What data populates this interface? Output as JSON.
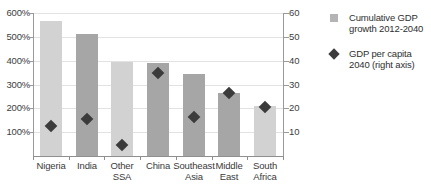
{
  "chart_data": {
    "type": "bar",
    "title": "",
    "categories": [
      "Nigeria",
      "India",
      "Other SSA",
      "China",
      "Southeast Asia",
      "Middle East",
      "South Africa"
    ],
    "series": [
      {
        "name": "Cumulative GDP growth 2012-2040",
        "type": "bar",
        "axis": "left",
        "unit": "%",
        "values": [
          565,
          510,
          395,
          390,
          345,
          265,
          210
        ]
      },
      {
        "name": "GDP per capita 2040 (right axis)",
        "type": "scatter",
        "axis": "right",
        "unit": "thousand dollars (2013)",
        "values": [
          12.5,
          15.5,
          4.5,
          35.0,
          16.5,
          26.5,
          20.5
        ]
      }
    ],
    "xlabel": "",
    "ylabel": "",
    "ylabel_right": "Thousand dollars (2013)",
    "ylim": [
      0,
      600
    ],
    "ylim_right": [
      0,
      60
    ],
    "yticks": [
      "100%",
      "200%",
      "300%",
      "400%",
      "500%",
      "600%"
    ],
    "ytick_values": [
      100,
      200,
      300,
      400,
      500,
      600
    ],
    "yticks_right": [
      "10",
      "20",
      "30",
      "40",
      "50",
      "60"
    ],
    "ytick_values_right": [
      10,
      20,
      30,
      40,
      50,
      60
    ],
    "grid": true,
    "legend_position": "right",
    "bar_colors": [
      "#d2d2d2",
      "#a6a6a6",
      "#d2d2d2",
      "#a6a6a6",
      "#a6a6a6",
      "#a6a6a6",
      "#d2d2d2"
    ],
    "marker_color": "#3b3b3b"
  },
  "legend": {
    "items": [
      {
        "label_line1": "Cumulative GDP",
        "label_line2": "growth 2012-2040",
        "marker": "square-swatch"
      },
      {
        "label_line1": "GDP per capita",
        "label_line2": "2040 (right axis)",
        "marker": "diamond-marker"
      }
    ]
  },
  "axes": {
    "right_title": "Thousand dollars (2013)"
  },
  "categories_display": [
    {
      "line1": "Nigeria",
      "line2": ""
    },
    {
      "line1": "India",
      "line2": ""
    },
    {
      "line1": "Other",
      "line2": "SSA"
    },
    {
      "line1": "China",
      "line2": ""
    },
    {
      "line1": "Southeast",
      "line2": "Asia"
    },
    {
      "line1": "Middle",
      "line2": "East"
    },
    {
      "line1": "South",
      "line2": "Africa"
    }
  ],
  "y_left_ticks": [
    "600%",
    "500%",
    "400%",
    "300%",
    "200%",
    "100%"
  ],
  "y_right_ticks": [
    "60",
    "50",
    "40",
    "30",
    "20",
    "10"
  ]
}
